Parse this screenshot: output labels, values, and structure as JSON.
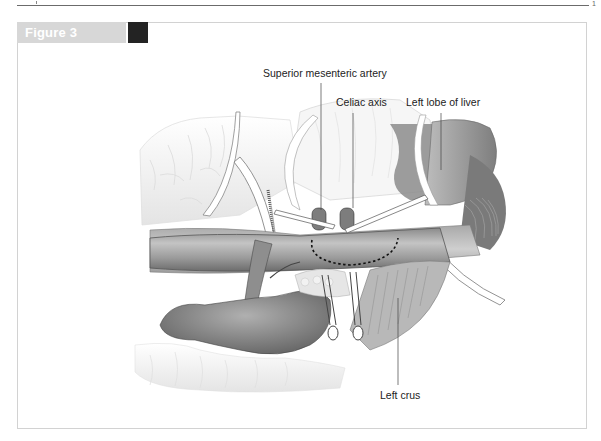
{
  "page": {
    "top_rule": true,
    "corner_mark": "1"
  },
  "figure": {
    "header_label": "Figure 3",
    "accent_colors": {
      "header_bar": "#d7d7d7",
      "header_swatch": "#232323",
      "frame_border": "#d2d2d2"
    },
    "labels": {
      "superior_mesenteric_artery": "Superior mesenteric artery",
      "celiac_axis": "Celiac axis",
      "left_lobe_of_liver": "Left lobe of liver",
      "left_crus": "Left crus"
    }
  }
}
